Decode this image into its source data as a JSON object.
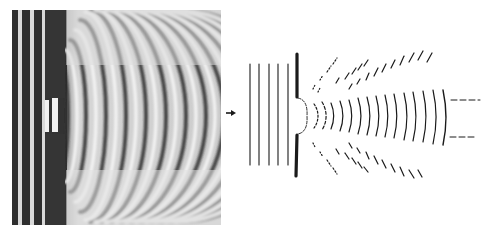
{
  "figure": {
    "left_panel": "ripple-tank-photograph",
    "right_panel": "wavefront-schematic",
    "arrow_label": ""
  },
  "colors": {
    "ink": "#1a1a1a",
    "photo_light": "#e6e6e6",
    "photo_dark": "#3a3a3a",
    "background": "#ffffff"
  }
}
